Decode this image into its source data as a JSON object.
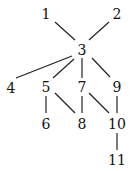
{
  "diagram": {
    "type": "graph",
    "nodes": [
      {
        "id": "1",
        "label": "1",
        "x": 46,
        "y": 14
      },
      {
        "id": "2",
        "label": "2",
        "x": 117,
        "y": 14
      },
      {
        "id": "3",
        "label": "3",
        "x": 82,
        "y": 50
      },
      {
        "id": "4",
        "label": "4",
        "x": 11,
        "y": 88
      },
      {
        "id": "5",
        "label": "5",
        "x": 46,
        "y": 87
      },
      {
        "id": "7",
        "label": "7",
        "x": 82,
        "y": 87
      },
      {
        "id": "9",
        "label": "9",
        "x": 117,
        "y": 87
      },
      {
        "id": "6",
        "label": "6",
        "x": 46,
        "y": 124
      },
      {
        "id": "8",
        "label": "8",
        "x": 82,
        "y": 124
      },
      {
        "id": "10",
        "label": "10",
        "x": 117,
        "y": 124
      },
      {
        "id": "11",
        "label": "11",
        "x": 117,
        "y": 160
      }
    ],
    "edges": [
      {
        "from": "1",
        "to": "3",
        "x1": 55,
        "y1": 22,
        "x2": 75,
        "y2": 40
      },
      {
        "from": "2",
        "to": "3",
        "x1": 109,
        "y1": 22,
        "x2": 89,
        "y2": 40
      },
      {
        "from": "3",
        "to": "4",
        "x1": 72,
        "y1": 56,
        "x2": 16,
        "y2": 78
      },
      {
        "from": "3",
        "to": "5",
        "x1": 74,
        "y1": 59,
        "x2": 53,
        "y2": 78
      },
      {
        "from": "3",
        "to": "7",
        "x1": 82,
        "y1": 58,
        "x2": 82,
        "y2": 78
      },
      {
        "from": "3",
        "to": "9",
        "x1": 92,
        "y1": 58,
        "x2": 110,
        "y2": 77
      },
      {
        "from": "5",
        "to": "6",
        "x1": 46,
        "y1": 96,
        "x2": 46,
        "y2": 113
      },
      {
        "from": "5",
        "to": "8",
        "x1": 55,
        "y1": 93,
        "x2": 75,
        "y2": 113
      },
      {
        "from": "7",
        "to": "8",
        "x1": 82,
        "y1": 96,
        "x2": 82,
        "y2": 113
      },
      {
        "from": "7",
        "to": "10",
        "x1": 89,
        "y1": 93,
        "x2": 109,
        "y2": 113
      },
      {
        "from": "9",
        "to": "10",
        "x1": 117,
        "y1": 96,
        "x2": 117,
        "y2": 113
      },
      {
        "from": "10",
        "to": "11",
        "x1": 117,
        "y1": 133,
        "x2": 117,
        "y2": 150
      }
    ]
  }
}
